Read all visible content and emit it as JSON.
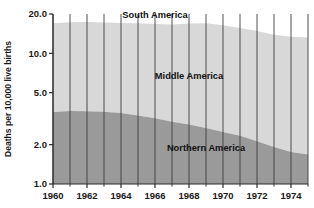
{
  "chart_data": {
    "type": "area",
    "stacked": true,
    "title": "",
    "subtitle": "",
    "xlabel": "",
    "ylabel": "Deaths per 10,000 live births",
    "x": [
      1960,
      1961,
      1962,
      1963,
      1964,
      1965,
      1966,
      1967,
      1968,
      1969,
      1970,
      1971,
      1972,
      1973,
      1974,
      1975
    ],
    "xlim": [
      1960,
      1975
    ],
    "ylim": [
      1.0,
      20.0
    ],
    "yscale": "log",
    "yticks": [
      1.0,
      2.0,
      5.0,
      10.0,
      20.0
    ],
    "ytick_labels": [
      "1.0",
      "2.0",
      "5.0",
      "10.0",
      "20.0"
    ],
    "xticks": [
      1960,
      1962,
      1964,
      1966,
      1968,
      1970,
      1972,
      1974
    ],
    "xtick_labels": [
      "1960",
      "1962",
      "1964",
      "1966",
      "1968",
      "1970",
      "1972",
      "1974"
    ],
    "xticks_minor": [
      1961,
      1963,
      1965,
      1967,
      1969,
      1971,
      1973,
      1975
    ],
    "grid": "vertical-yearly",
    "legend": "inline-labels",
    "series": [
      {
        "name": "Northern America",
        "color": "#9a9a9a",
        "label_x": 1969,
        "label_y": 1.78,
        "values": [
          3.55,
          3.62,
          3.6,
          3.58,
          3.5,
          3.35,
          3.18,
          3.0,
          2.85,
          2.68,
          2.5,
          2.34,
          2.12,
          1.92,
          1.76,
          1.68
        ]
      },
      {
        "name": "Middle America",
        "color": "#d8d8d8",
        "label_x": 1968,
        "label_y": 6.4,
        "cumulative_top": [
          17.0,
          17.3,
          17.4,
          17.2,
          17.1,
          17.0,
          16.8,
          16.6,
          16.9,
          17.0,
          16.4,
          15.6,
          14.8,
          13.9,
          13.4,
          13.2
        ]
      },
      {
        "name": "South America",
        "color": "#ffffff",
        "label_x": 1966,
        "label_y": 18.6
      }
    ]
  },
  "axes": {
    "ylabel": "Deaths per 10,000 live births",
    "ytick_labels": [
      "20.0",
      "10.0",
      "5.0",
      "2.0",
      "1.0"
    ],
    "xtick_labels": [
      "1960",
      "1962",
      "1964",
      "1966",
      "1968",
      "1970",
      "1972",
      "1974"
    ]
  },
  "labels": {
    "south_america": "South America",
    "middle_america": "Middle America",
    "northern_america": "Northern America"
  },
  "colors": {
    "northern_america": "#9a9a9a",
    "middle_america": "#d8d8d8",
    "south_america": "#ffffff",
    "gridline": "#3c3c3c",
    "axis": "#2a2a2a",
    "text": "#1a1a1a",
    "background": "#ffffff"
  }
}
